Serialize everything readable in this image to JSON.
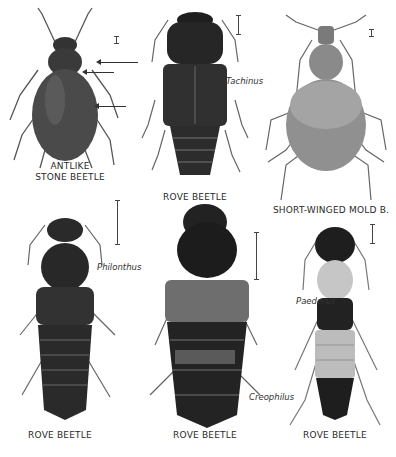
{
  "plate": {
    "figures": [
      {
        "id": "antlike-stone-beetle",
        "label_line1": "ANTLIKE",
        "label_line2": "STONE BEETLE",
        "genus": ""
      },
      {
        "id": "rove-beetle-tachinus",
        "label": "ROVE BEETLE",
        "genus": "Tachinus"
      },
      {
        "id": "short-winged-mold-beetle",
        "label": "SHORT-WINGED MOLD B.",
        "genus": ""
      },
      {
        "id": "rove-beetle-philonthus",
        "label": "ROVE BEETLE",
        "genus": "Philonthus"
      },
      {
        "id": "rove-beetle-creophilus",
        "label": "ROVE BEETLE",
        "genus": "Creophilus"
      },
      {
        "id": "rove-beetle-paederus",
        "label": "ROVE BEETLE",
        "genus": "Paederus"
      }
    ],
    "colors": {
      "ink": "#2a2a2a",
      "dark_body": "#262626",
      "mid_body": "#6a6a6a",
      "light_body": "#c8c8c8",
      "paper": "#ffffff"
    }
  }
}
